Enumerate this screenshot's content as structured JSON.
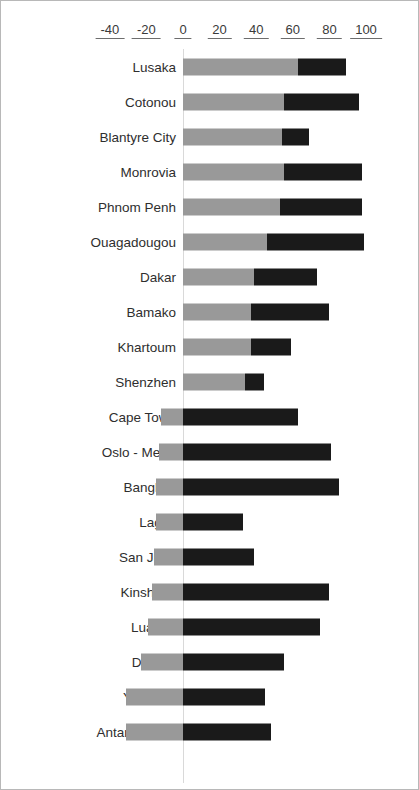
{
  "chart_data": {
    "type": "bar",
    "orientation": "horizontal",
    "stacked": true,
    "title": "",
    "subtitle": "",
    "xlabel": "",
    "ylabel": "",
    "xlim": [
      -50,
      108
    ],
    "axis_position": "top",
    "grid": false,
    "legend": "none",
    "tick_labels": [
      "-40",
      "-20",
      "0",
      "20",
      "40",
      "60",
      "80",
      "100"
    ],
    "tick_values": [
      -40,
      -20,
      0,
      20,
      40,
      60,
      80,
      100
    ],
    "colors": {
      "light_segment": "#999999",
      "dark_segment": "#1a1a1a",
      "zero_line": "#d9d9d9",
      "frame": "#b8b8b8",
      "tick_text": "#3a3a3a",
      "label_text": "#2e2e2e"
    },
    "categories": [
      "Lusaka",
      "Cotonou",
      "Blantyre City",
      "Monrovia",
      "Phnom Penh",
      "Ouagadougou",
      "Dakar",
      "Bamako",
      "Khartoum",
      "Shenzhen",
      "Cape Town",
      "Oslo  - Metro",
      "Bangkok",
      "Lagos",
      "San Juan",
      "Kinshasa",
      "Luanda",
      "Durban",
      "Yaoundé",
      "Antananarivo"
    ],
    "series": [
      {
        "name": "light",
        "color": "#999999",
        "values": [
          63,
          55,
          54,
          55,
          53,
          46,
          39,
          37,
          37,
          34,
          -12,
          -13,
          -15,
          -15,
          -16,
          -17,
          -19,
          -23,
          -31,
          -31
        ]
      },
      {
        "name": "dark",
        "color": "#1a1a1a",
        "values": [
          26,
          41,
          15,
          43,
          45,
          53,
          34,
          43,
          22,
          10,
          63,
          81,
          85,
          33,
          39,
          80,
          75,
          55,
          45,
          48
        ]
      }
    ],
    "bars": [
      {
        "label": "Lusaka",
        "start": 0,
        "split": 63,
        "end": 89
      },
      {
        "label": "Cotonou",
        "start": 0,
        "split": 55,
        "end": 96
      },
      {
        "label": "Blantyre City",
        "start": 0,
        "split": 54,
        "end": 69
      },
      {
        "label": "Monrovia",
        "start": 0,
        "split": 55,
        "end": 98
      },
      {
        "label": "Phnom Penh",
        "start": 0,
        "split": 53,
        "end": 98
      },
      {
        "label": "Ouagadougou",
        "start": 0,
        "split": 46,
        "end": 99
      },
      {
        "label": "Dakar",
        "start": 0,
        "split": 39,
        "end": 73
      },
      {
        "label": "Bamako",
        "start": 0,
        "split": 37,
        "end": 80
      },
      {
        "label": "Khartoum",
        "start": 0,
        "split": 37,
        "end": 59
      },
      {
        "label": "Shenzhen",
        "start": 0,
        "split": 34,
        "end": 44
      },
      {
        "label": "Cape Town",
        "start": -12,
        "split": 0,
        "end": 63
      },
      {
        "label": "Oslo  - Metro",
        "start": -13,
        "split": 0,
        "end": 81
      },
      {
        "label": "Bangkok",
        "start": -15,
        "split": 0,
        "end": 85
      },
      {
        "label": "Lagos",
        "start": -15,
        "split": 0,
        "end": 33
      },
      {
        "label": "San Juan",
        "start": -16,
        "split": 0,
        "end": 39
      },
      {
        "label": "Kinshasa",
        "start": -17,
        "split": 0,
        "end": 80
      },
      {
        "label": "Luanda",
        "start": -19,
        "split": 0,
        "end": 75
      },
      {
        "label": "Durban",
        "start": -23,
        "split": 0,
        "end": 55
      },
      {
        "label": "Yaoundé",
        "start": -31,
        "split": 0,
        "end": 45
      },
      {
        "label": "Antananarivo",
        "start": -31,
        "split": 0,
        "end": 48
      }
    ]
  }
}
